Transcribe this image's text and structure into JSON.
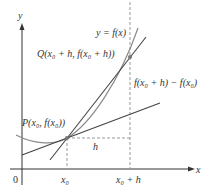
{
  "diagram": {
    "axis_y_label": "y",
    "axis_x_label": "x",
    "origin_label": "0",
    "curve_label": "y = f(x)",
    "point_q_label": "Q(x₀ + h, f(x₀ + h))",
    "point_p_label": "P(x₀, f(x₀))",
    "rise_label": "f(x₀ + h) − f(x₀)",
    "run_label": "h",
    "tick_x0": "x₀",
    "tick_x0h": "x₀ + h",
    "colors": {
      "axes": "#333333",
      "curve": "#8a8a8a",
      "lines": "#444444",
      "dashed": "#999999"
    }
  }
}
